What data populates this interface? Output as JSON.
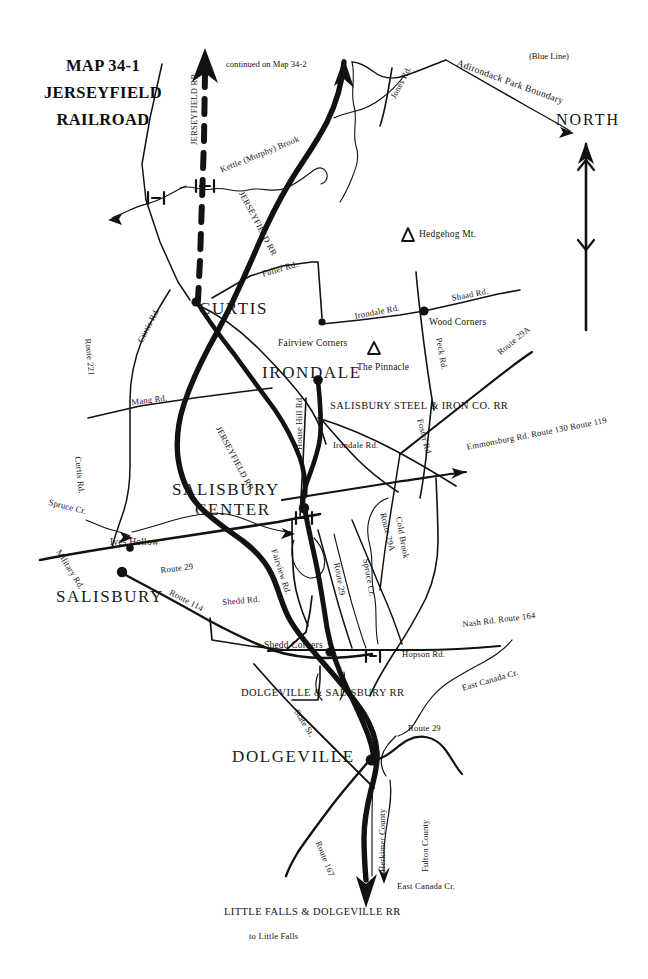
{
  "map": {
    "title_lines": [
      "MAP 34-1",
      "JERSEYFIELD",
      "RAILROAD"
    ],
    "compass": {
      "label": "NORTH",
      "icon": "north-arrow-icon"
    },
    "continuation_note": "continued on Map 34-2",
    "boundary": {
      "label": "Adirondack Park Boundary",
      "sub_label": "(Blue Line)"
    },
    "railroads": [
      {
        "name": "JERSEYFIELD RR",
        "style": "dashed-branch"
      },
      {
        "name": "JERSEYFIELD RR",
        "style": "solid-main"
      },
      {
        "name": "JERSEYFIELD RR",
        "style": "solid-main"
      },
      {
        "name": "SALISBURY STEEL & IRON CO. RR",
        "style": "thin"
      },
      {
        "name": "DOLGEVILLE & SALISBURY RR",
        "style": "thin"
      },
      {
        "name": "LITTLE FALLS & DOLGEVILLE RR",
        "style": "thin"
      }
    ],
    "towns": [
      {
        "name": "CURTIS"
      },
      {
        "name": "IRONDALE"
      },
      {
        "name": "SALISBURY"
      },
      {
        "name": "SALISBURY",
        "name2": "CENTER"
      },
      {
        "name": "DOLGEVILLE"
      }
    ],
    "places": [
      {
        "name": "Fairview Corners"
      },
      {
        "name": "Wood Corners"
      },
      {
        "name": "Ives Hollow"
      },
      {
        "name": "Shedd Corners"
      },
      {
        "name": "The Pinnacle",
        "marker": "triangle"
      },
      {
        "name": "Hedgehog Mt.",
        "marker": "triangle"
      }
    ],
    "roads": [
      "Jones Rd.",
      "Fuller Rd.",
      "Irondale Rd.",
      "Shaad Rd.",
      "Peck Rd.",
      "Route 29A",
      "Curtis Rd.",
      "Route 221",
      "Mang Rd.",
      "House Hill Rd.",
      "Foster Rd.",
      "Emmonsburg Rd.  Route 130  Route 119",
      "Military Rd.",
      "Route 29",
      "Route 114",
      "Shedd Rd.",
      "Fairview Rd.",
      "Nash Rd.  Route 164",
      "Hopson Rd.",
      "State St.",
      "Route 167"
    ],
    "waters": [
      "Kettle (Murphy) Brook",
      "Spruce Cr.",
      "Cold Brook",
      "East Canada Cr."
    ],
    "counties": [
      "Herkimer County",
      "Fulton County"
    ],
    "terminus_note": "to Little  Falls",
    "labels": {
      "jerseyfield_rr": "JERSEYFIELD RR",
      "salisbury_steel": "SALISBURY STEEL & IRON CO. RR",
      "dolgeville_salisbury": "DOLGEVILLE & SALISBURY RR",
      "little_falls_dolgeville": "LITTLE FALLS & DOLGEVILLE RR",
      "curtis": "CURTIS",
      "irondale": "IRONDALE",
      "salisbury": "SALISBURY",
      "salisbury_center_1": "SALISBURY",
      "salisbury_center_2": "CENTER",
      "dolgeville": "DOLGEVILLE",
      "fairview_corners": "Fairview Corners",
      "wood_corners": "Wood Corners",
      "ives_hollow": "Ives Hollow",
      "shedd_corners": "Shedd Corners",
      "the_pinnacle": "The Pinnacle",
      "hedgehog_mt": "Hedgehog Mt.",
      "jones_rd": "Jones Rd.",
      "fuller_rd": "Fuller Rd.",
      "irondale_rd_1": "Irondale Rd.",
      "irondale_rd_2": "Irondale Rd.",
      "shaad_rd": "Shaad Rd.",
      "peck_rd": "Peck Rd.",
      "route_29a_1": "Route 29A",
      "route_29a_2": "Route 29A",
      "curtis_rd_1": "Curtis Rd.",
      "curtis_rd_2": "Curtis Rd.",
      "route_221": "Route 221",
      "mang_rd": "Mang Rd.",
      "house_hill_rd": "House Hill Rd.",
      "foster_rd": "Foster Rd.",
      "emmonsburg": "Emmonsburg Rd.  Route 130  Route 119",
      "military_rd": "Military Rd.",
      "route_29_1": "Route 29",
      "route_29_2": "Route 29",
      "route_29_3": "Route 29",
      "route_114": "Route 114",
      "shedd_rd": "Shedd Rd.",
      "fairview_rd": "Fairview Rd.",
      "nash_rd": "Nash Rd.  Route 164",
      "hopson_rd": "Hopson Rd.",
      "state_st": "State St.",
      "route_167": "Route 167",
      "kettle_brook": "Kettle (Murphy) Brook",
      "spruce_cr_1": "Spruce Cr.",
      "spruce_cr_2": "Spruce Cr.",
      "cold_brook": "Cold Brook",
      "east_canada_1": "East Canada Cr.",
      "east_canada_2": "East Canada Cr.",
      "herkimer_county": "Herkimer County",
      "fulton_county": "Fulton County",
      "adirondack_boundary": "Adirondack Park Boundary",
      "blue_line": "(Blue Line)",
      "continued": "continued on Map 34-2",
      "north": "NORTH",
      "to_little_falls": "to Little  Falls"
    },
    "colors": {
      "ink": "#111111",
      "paper": "#ffffff"
    }
  }
}
